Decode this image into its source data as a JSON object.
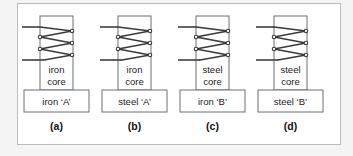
{
  "figure": {
    "frame_border_color": "#b9bcbe",
    "page_background": "#f4f4f4",
    "panel_background": "#ffffff",
    "wire_color": "#3a3a3c",
    "box_outline_color": "#6d6f72",
    "text_color": "#1a1a1a"
  },
  "panels": [
    {
      "id": "panel-a",
      "letter": "(a)",
      "core_label_line1": "iron",
      "core_label_line2": "core",
      "base_label": "iron ‘A’",
      "coil_turns": 3
    },
    {
      "id": "panel-b",
      "letter": "(b)",
      "core_label_line1": "iron",
      "core_label_line2": "core",
      "base_label": "steel ‘A’",
      "coil_turns": 3
    },
    {
      "id": "panel-c",
      "letter": "(c)",
      "core_label_line1": "steel",
      "core_label_line2": "core",
      "base_label": "iron ‘B’",
      "coil_turns": 3
    },
    {
      "id": "panel-d",
      "letter": "(d)",
      "core_label_line1": "steel",
      "core_label_line2": "core",
      "base_label": "steel ‘B’",
      "coil_turns": 3
    }
  ]
}
